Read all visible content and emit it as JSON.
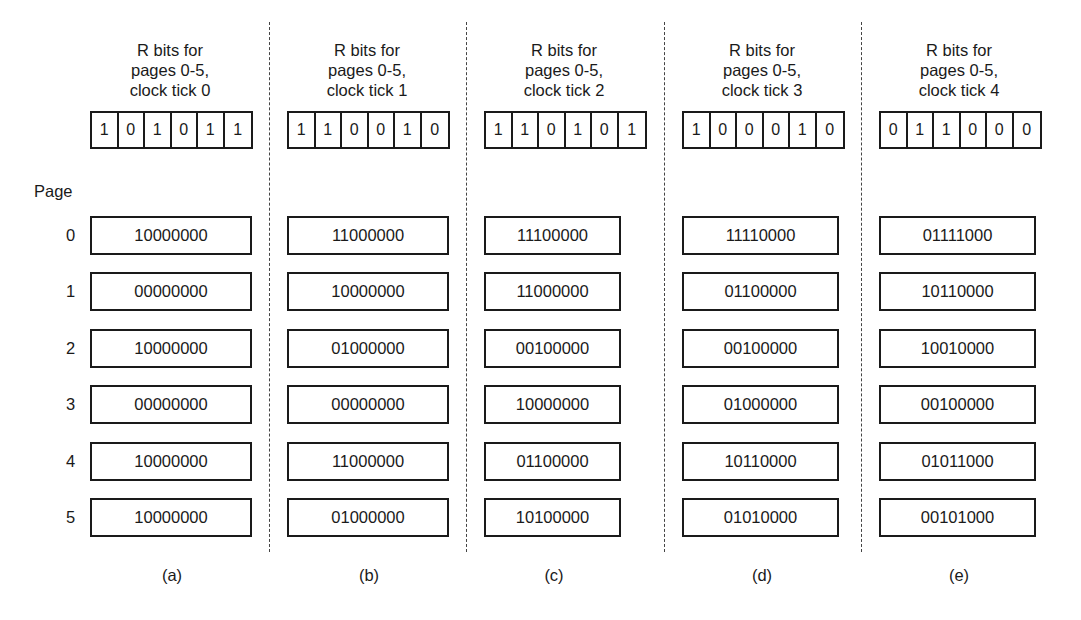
{
  "figure": {
    "page_heading": "Page",
    "page_numbers": [
      "0",
      "1",
      "2",
      "3",
      "4",
      "5"
    ],
    "columns": [
      {
        "header": [
          "R bits for",
          "pages 0-5,",
          "clock tick 0"
        ],
        "r_bits": [
          "1",
          "0",
          "1",
          "0",
          "1",
          "1"
        ],
        "counters": [
          "10000000",
          "00000000",
          "10000000",
          "00000000",
          "10000000",
          "10000000"
        ],
        "label": "(a)"
      },
      {
        "header": [
          "R bits for",
          "pages 0-5,",
          "clock tick 1"
        ],
        "r_bits": [
          "1",
          "1",
          "0",
          "0",
          "1",
          "0"
        ],
        "counters": [
          "11000000",
          "10000000",
          "01000000",
          "00000000",
          "11000000",
          "01000000"
        ],
        "label": "(b)"
      },
      {
        "header": [
          "R bits for",
          "pages 0-5,",
          "clock tick 2"
        ],
        "r_bits": [
          "1",
          "1",
          "0",
          "1",
          "0",
          "1"
        ],
        "counters": [
          "11100000",
          "11000000",
          "00100000",
          "10000000",
          "01100000",
          "10100000"
        ],
        "label": "(c)"
      },
      {
        "header": [
          "R bits for",
          "pages 0-5,",
          "clock tick 3"
        ],
        "r_bits": [
          "1",
          "0",
          "0",
          "0",
          "1",
          "0"
        ],
        "counters": [
          "11110000",
          "01100000",
          "00100000",
          "01000000",
          "10110000",
          "01010000"
        ],
        "label": "(d)"
      },
      {
        "header": [
          "R bits for",
          "pages 0-5,",
          "clock tick 4"
        ],
        "r_bits": [
          "0",
          "1",
          "1",
          "0",
          "0",
          "0"
        ],
        "counters": [
          "01111000",
          "10110000",
          "10010000",
          "00100000",
          "01011000",
          "00101000"
        ],
        "label": "(e)"
      }
    ]
  }
}
